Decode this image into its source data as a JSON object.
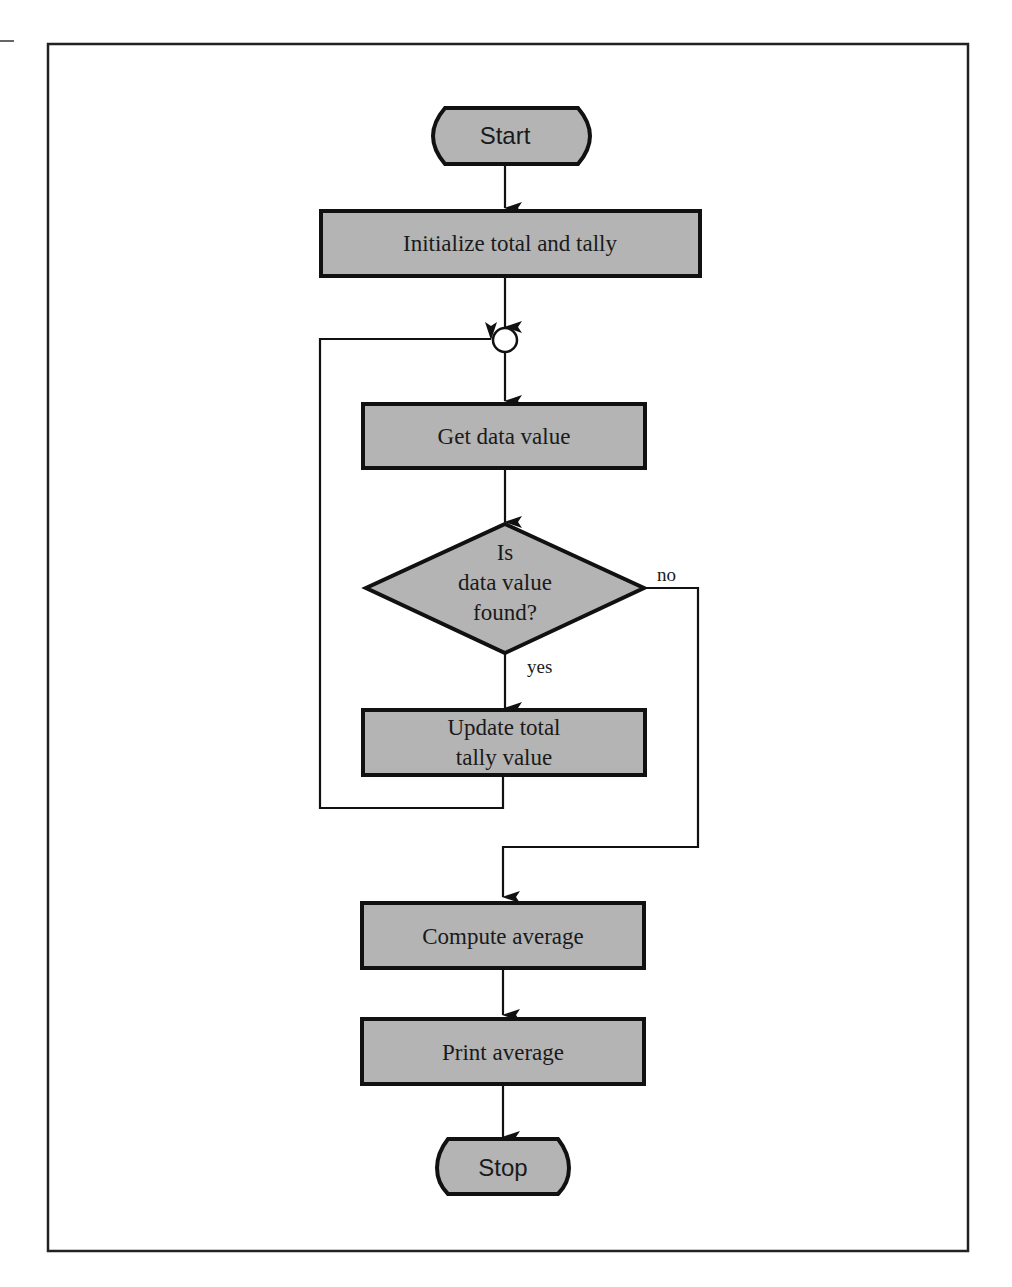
{
  "diagram": {
    "type": "flowchart",
    "nodes": {
      "start": {
        "shape": "terminal",
        "label": "Start"
      },
      "init": {
        "shape": "process",
        "label": "Initialize total and tally"
      },
      "junction": {
        "shape": "connector",
        "label": ""
      },
      "get": {
        "shape": "process",
        "label": "Get data value"
      },
      "decision": {
        "shape": "decision",
        "lines": [
          "Is",
          "data value",
          "found?"
        ]
      },
      "update": {
        "shape": "process",
        "lines": [
          "Update total",
          "tally value"
        ]
      },
      "compute": {
        "shape": "process",
        "label": "Compute average"
      },
      "print": {
        "shape": "process",
        "label": "Print average"
      },
      "stop": {
        "shape": "terminal",
        "label": "Stop"
      }
    },
    "edges": [
      {
        "from": "start",
        "to": "init",
        "label": ""
      },
      {
        "from": "init",
        "to": "junction",
        "label": ""
      },
      {
        "from": "junction",
        "to": "get",
        "label": ""
      },
      {
        "from": "get",
        "to": "decision",
        "label": ""
      },
      {
        "from": "decision",
        "to": "update",
        "label": "yes"
      },
      {
        "from": "update",
        "to": "junction",
        "label": ""
      },
      {
        "from": "decision",
        "to": "compute",
        "label": "no"
      },
      {
        "from": "compute",
        "to": "print",
        "label": ""
      },
      {
        "from": "print",
        "to": "stop",
        "label": ""
      }
    ],
    "edge_labels": {
      "yes": "yes",
      "no": "no"
    },
    "colors": {
      "shape_fill": "#b4b4b4",
      "stroke": "#111111",
      "background": "#ffffff"
    }
  }
}
